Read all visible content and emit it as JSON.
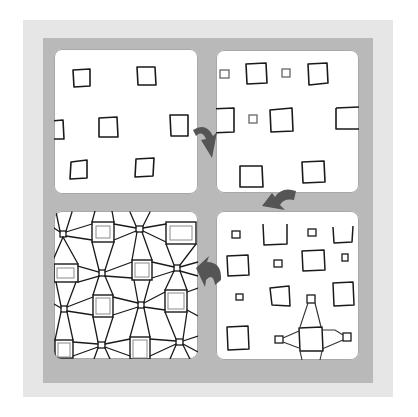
{
  "figure": {
    "colors": {
      "background": "#ffffff",
      "outer_frame": "#e6e6e6",
      "inner_frame": "#b9b9b9",
      "panel": "#ffffff",
      "ink": "#1a1a1a",
      "ink_light": "#555555",
      "arrow": "#555555"
    },
    "panels": [
      {
        "id": "step-1",
        "position": "top-left",
        "label": "Scattered large squares"
      },
      {
        "id": "step-2",
        "position": "top-right",
        "label": "Small squares added between large squares"
      },
      {
        "id": "step-3",
        "position": "bottom-right",
        "label": "Squares connected with lines to neighboring small squares"
      },
      {
        "id": "step-4",
        "position": "bottom-left",
        "label": "Completed network with double-outlined squares"
      }
    ],
    "arrows": [
      {
        "from": "step-1",
        "to": "step-2",
        "icon": "curved-arrow-down"
      },
      {
        "from": "step-2",
        "to": "step-3",
        "icon": "curved-arrow-down-left"
      },
      {
        "from": "step-3",
        "to": "step-4",
        "icon": "curved-arrow-left"
      }
    ]
  }
}
